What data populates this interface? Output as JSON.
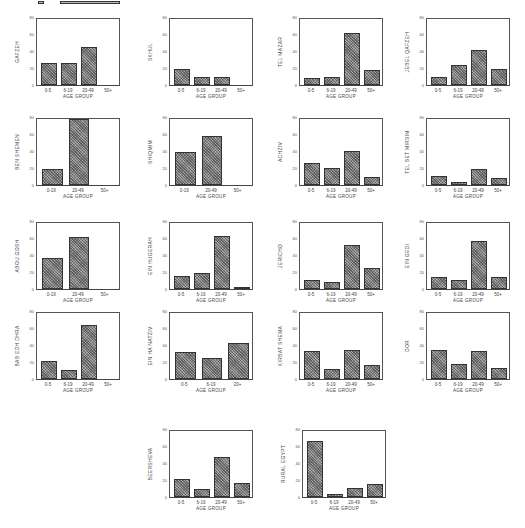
{
  "header": {
    "text": ""
  },
  "chart_data": [
    {
      "id": "gafzeh",
      "type": "bar",
      "ylabel": "GAFZEH",
      "xlabel": "AGE GROUP",
      "categories": [
        "0-5",
        "6-19",
        "20-49",
        "50+"
      ],
      "values": [
        27,
        27,
        46,
        0
      ],
      "ylim": [
        0,
        80
      ],
      "yticks": [
        0,
        20,
        40,
        60,
        80
      ],
      "pos": {
        "left": 12,
        "top": 12
      }
    },
    {
      "id": "skhul",
      "type": "bar",
      "ylabel": "SKHUL",
      "xlabel": "AGE GROUP",
      "categories": [
        "0-5",
        "6-19",
        "20-49",
        "50+"
      ],
      "values": [
        20,
        10,
        10,
        0
      ],
      "ylim": [
        0,
        80
      ],
      "yticks": [
        0,
        20,
        40,
        60,
        80
      ],
      "pos": {
        "left": 145,
        "top": 12
      }
    },
    {
      "id": "tel-mazar",
      "type": "bar",
      "ylabel": "TEL MAZAR",
      "xlabel": "AGE GROUP",
      "categories": [
        "0-5",
        "6-19",
        "20-49",
        "50+"
      ],
      "values": [
        8,
        10,
        63,
        18
      ],
      "ylim": [
        0,
        80
      ],
      "yticks": [
        0,
        20,
        40,
        60,
        80
      ],
      "pos": {
        "left": 275,
        "top": 12
      }
    },
    {
      "id": "jebel-qafzeh",
      "type": "bar",
      "ylabel": "JEBEL QAFZEH",
      "xlabel": "AGE GROUP",
      "categories": [
        "0-5",
        "6-19",
        "20-49",
        "50+"
      ],
      "values": [
        10,
        24,
        43,
        20
      ],
      "ylim": [
        0,
        80
      ],
      "yticks": [
        0,
        20,
        40,
        60,
        80
      ],
      "pos": {
        "left": 402,
        "top": 12
      }
    },
    {
      "id": "ben-shemen",
      "type": "bar",
      "ylabel": "BEN SHEMEN",
      "xlabel": "AGE GROUP",
      "categories": [
        "0-19",
        "20-49",
        "50+"
      ],
      "values": [
        20,
        80,
        0
      ],
      "ylim": [
        0,
        80
      ],
      "yticks": [
        0,
        20,
        40,
        60,
        80
      ],
      "pos": {
        "left": 12,
        "top": 112
      }
    },
    {
      "id": "shiqmim",
      "type": "bar",
      "ylabel": "SHIQMIM",
      "xlabel": "AGE GROUP",
      "categories": [
        "0-19",
        "20-49",
        "50+"
      ],
      "values": [
        40,
        60,
        0
      ],
      "ylim": [
        0,
        80
      ],
      "yticks": [
        0,
        20,
        40,
        60,
        80
      ],
      "pos": {
        "left": 145,
        "top": 112
      }
    },
    {
      "id": "achziv",
      "type": "bar",
      "ylabel": "ACHZIV",
      "xlabel": "AGE GROUP",
      "categories": [
        "0-5",
        "6-19",
        "20-49",
        "50+"
      ],
      "values": [
        27,
        21,
        41,
        10
      ],
      "ylim": [
        0,
        80
      ],
      "yticks": [
        0,
        20,
        40,
        60,
        80
      ],
      "pos": {
        "left": 275,
        "top": 112
      }
    },
    {
      "id": "tel-bet-mirsim",
      "type": "bar",
      "ylabel": "TEL BET MIRSIM",
      "xlabel": "AGE GROUP",
      "categories": [
        "0-5",
        "6-19",
        "20-49",
        "50+"
      ],
      "values": [
        11,
        4,
        20,
        8
      ],
      "ylim": [
        0,
        80
      ],
      "yticks": [
        0,
        20,
        40,
        60,
        80
      ],
      "pos": {
        "left": 402,
        "top": 112
      }
    },
    {
      "id": "abou-gosh",
      "type": "bar",
      "ylabel": "ABOU GOSH",
      "xlabel": "AGE GROUP",
      "categories": [
        "0-19",
        "20-49",
        "50+"
      ],
      "values": [
        37,
        63,
        0
      ],
      "ylim": [
        0,
        80
      ],
      "yticks": [
        0,
        20,
        40,
        60,
        80
      ],
      "pos": {
        "left": 12,
        "top": 216
      }
    },
    {
      "id": "ein-hugerah",
      "type": "bar",
      "ylabel": "EIN HUGERAH",
      "xlabel": "AGE GROUP",
      "categories": [
        "0-5",
        "6-19",
        "20-49",
        "50+"
      ],
      "values": [
        16,
        20,
        64,
        1
      ],
      "ylim": [
        0,
        80
      ],
      "yticks": [
        0,
        20,
        40,
        60,
        80
      ],
      "pos": {
        "left": 145,
        "top": 216
      }
    },
    {
      "id": "jericho",
      "type": "bar",
      "ylabel": "JERICHO",
      "xlabel": "AGE GROUP",
      "categories": [
        "0-5",
        "6-19",
        "20-49",
        "50+"
      ],
      "values": [
        11,
        9,
        53,
        25
      ],
      "ylim": [
        0,
        80
      ],
      "yticks": [
        0,
        20,
        40,
        60,
        80
      ],
      "pos": {
        "left": 275,
        "top": 216
      }
    },
    {
      "id": "ein-gedi",
      "type": "bar",
      "ylabel": "EIN GEDI",
      "xlabel": "AGE GROUP",
      "categories": [
        "0-5",
        "6-19",
        "20-49",
        "50+"
      ],
      "values": [
        15,
        11,
        58,
        15
      ],
      "ylim": [
        0,
        80
      ],
      "yticks": [
        0,
        20,
        40,
        60,
        80
      ],
      "pos": {
        "left": 402,
        "top": 216
      }
    },
    {
      "id": "bab-edh-dhra",
      "type": "bar",
      "ylabel": "BAB EDH DHRA",
      "xlabel": "AGE GROUP",
      "categories": [
        "0-5",
        "6-19",
        "20-49",
        "50+"
      ],
      "values": [
        22,
        11,
        66,
        0
      ],
      "ylim": [
        0,
        80
      ],
      "yticks": [
        0,
        20,
        40,
        60,
        80
      ],
      "pos": {
        "left": 12,
        "top": 306
      }
    },
    {
      "id": "ein-ha-natziv",
      "type": "bar",
      "ylabel": "EIN HA NATZIV",
      "xlabel": "AGE GROUP",
      "categories": [
        "0-5",
        "6-19",
        "20+"
      ],
      "values": [
        33,
        25,
        44
      ],
      "ylim": [
        0,
        80
      ],
      "yticks": [
        0,
        20,
        40,
        60,
        80
      ],
      "pos": {
        "left": 145,
        "top": 306
      }
    },
    {
      "id": "kirbat-shema",
      "type": "bar",
      "ylabel": "KIRBAT SHEMA",
      "xlabel": "AGE GROUP",
      "categories": [
        "0-5",
        "6-19",
        "20-49",
        "50+"
      ],
      "values": [
        34,
        12,
        35,
        17
      ],
      "ylim": [
        0,
        80
      ],
      "yticks": [
        0,
        20,
        40,
        60,
        80
      ],
      "pos": {
        "left": 275,
        "top": 306
      }
    },
    {
      "id": "dor",
      "type": "bar",
      "ylabel": "DOR",
      "xlabel": "AGE GROUP",
      "categories": [
        "0-5",
        "6-19",
        "20-49",
        "50+"
      ],
      "values": [
        35,
        18,
        34,
        13
      ],
      "ylim": [
        0,
        80
      ],
      "yticks": [
        0,
        20,
        40,
        60,
        80
      ],
      "pos": {
        "left": 402,
        "top": 306
      }
    },
    {
      "id": "beersheva",
      "type": "bar",
      "ylabel": "BEERSHEVA",
      "xlabel": "AGE GROUP",
      "categories": [
        "0-5",
        "6-19",
        "20-49",
        "50+"
      ],
      "values": [
        22,
        10,
        49,
        17
      ],
      "ylim": [
        0,
        80
      ],
      "yticks": [
        0,
        20,
        40,
        60,
        80
      ],
      "pos": {
        "left": 145,
        "top": 424
      }
    },
    {
      "id": "rural-egypt",
      "type": "bar",
      "ylabel": "RURAL EGYPT",
      "xlabel": "AGE GROUP",
      "categories": [
        "0-5",
        "6-19",
        "20-49",
        "50+"
      ],
      "values": [
        68,
        4,
        11,
        16
      ],
      "ylim": [
        0,
        80
      ],
      "yticks": [
        0,
        20,
        40,
        60,
        80
      ],
      "pos": {
        "left": 278,
        "top": 424
      }
    }
  ]
}
